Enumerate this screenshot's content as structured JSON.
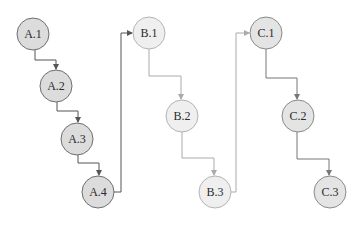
{
  "diagram": {
    "nodes": [
      {
        "id": "A.1",
        "label": "A.1",
        "group": "A",
        "cx": 33,
        "cy": 34
      },
      {
        "id": "A.2",
        "label": "A.2",
        "group": "A",
        "cx": 56,
        "cy": 86
      },
      {
        "id": "A.3",
        "label": "A.3",
        "group": "A",
        "cx": 77,
        "cy": 139
      },
      {
        "id": "A.4",
        "label": "A.4",
        "group": "A",
        "cx": 98,
        "cy": 192
      },
      {
        "id": "B.1",
        "label": "B.1",
        "group": "B",
        "cx": 149,
        "cy": 33
      },
      {
        "id": "B.2",
        "label": "B.2",
        "group": "B",
        "cx": 182,
        "cy": 116
      },
      {
        "id": "B.3",
        "label": "B.3",
        "group": "B",
        "cx": 215,
        "cy": 192
      },
      {
        "id": "C.1",
        "label": "C.1",
        "group": "C",
        "cx": 266,
        "cy": 33
      },
      {
        "id": "C.2",
        "label": "C.2",
        "group": "C",
        "cx": 298,
        "cy": 116
      },
      {
        "id": "C.3",
        "label": "C.3",
        "group": "C",
        "cx": 330,
        "cy": 192
      }
    ],
    "edges": [
      {
        "from": "A.1",
        "to": "A.2"
      },
      {
        "from": "A.2",
        "to": "A.3"
      },
      {
        "from": "A.3",
        "to": "A.4"
      },
      {
        "from": "A.4",
        "to": "B.1"
      },
      {
        "from": "B.1",
        "to": "B.2"
      },
      {
        "from": "B.2",
        "to": "B.3"
      },
      {
        "from": "B.3",
        "to": "C.1"
      },
      {
        "from": "C.1",
        "to": "C.2"
      },
      {
        "from": "C.2",
        "to": "C.3"
      }
    ],
    "colors": {
      "A_fill": "#dcdcdc",
      "A_stroke": "#6e6e6e",
      "A_edge": "#555555",
      "B_fill": "#efefef",
      "B_stroke": "#b4b4b4",
      "B_edge": "#aaaaaa",
      "C_fill": "#e4e4e4",
      "C_stroke": "#8a8a8a",
      "C_edge": "#777777"
    }
  }
}
